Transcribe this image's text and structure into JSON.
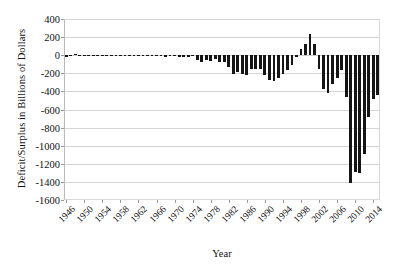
{
  "chart_data": {
    "type": "bar",
    "title": "",
    "xlabel": "Year",
    "ylabel": "Deficit/Surplus in Billions of Dollars",
    "ylim": [
      -1600,
      400
    ],
    "ytick_values": [
      400,
      200,
      0,
      -200,
      -400,
      -600,
      -800,
      -1000,
      -1200,
      -1400,
      -1600
    ],
    "ytick_labels": [
      "400",
      "200",
      "0",
      "-200",
      "-400",
      "-600",
      "-800",
      "-1000",
      "-1200",
      "-1400",
      "-1600"
    ],
    "xtick_labels": [
      "1946",
      "1950",
      "1954",
      "1958",
      "1962",
      "1966",
      "1970",
      "1974",
      "1978",
      "1982",
      "1986",
      "1990",
      "1994",
      "1998",
      "2002",
      "2006",
      "2010",
      "2014"
    ],
    "xtick_step": 4,
    "grid": true,
    "legend": "none",
    "bar_color": "#151515",
    "grid_color": "#d5d5d5",
    "categories": [
      "1946",
      "1947",
      "1948",
      "1949",
      "1950",
      "1951",
      "1952",
      "1953",
      "1954",
      "1955",
      "1956",
      "1957",
      "1958",
      "1959",
      "1960",
      "1961",
      "1962",
      "1963",
      "1964",
      "1965",
      "1966",
      "1967",
      "1968",
      "1969",
      "1970",
      "1971",
      "1972",
      "1973",
      "1974",
      "1975",
      "1976",
      "1977",
      "1978",
      "1979",
      "1980",
      "1981",
      "1982",
      "1983",
      "1984",
      "1985",
      "1986",
      "1987",
      "1988",
      "1989",
      "1990",
      "1991",
      "1992",
      "1993",
      "1994",
      "1995",
      "1996",
      "1997",
      "1998",
      "1999",
      "2000",
      "2001",
      "2002",
      "2003",
      "2004",
      "2005",
      "2006",
      "2007",
      "2008",
      "2009",
      "2010",
      "2011",
      "2012",
      "2013",
      "2014",
      "2015"
    ],
    "values": [
      -15.9,
      4.0,
      11.8,
      0.6,
      -3.1,
      6.1,
      -1.5,
      -6.5,
      -1.2,
      -3.0,
      3.9,
      3.4,
      -2.8,
      -12.8,
      0.3,
      -3.3,
      -7.1,
      -4.8,
      -5.9,
      -1.4,
      -3.7,
      -8.6,
      -25.2,
      3.2,
      -2.8,
      -23.0,
      -23.4,
      -14.9,
      -6.1,
      -53.2,
      -73.7,
      -53.7,
      -59.2,
      -40.7,
      -73.8,
      -79.0,
      -128.0,
      -207.8,
      -185.4,
      -212.3,
      -221.2,
      -149.7,
      -155.2,
      -152.6,
      -221.0,
      -269.2,
      -290.3,
      -255.1,
      -203.2,
      -164.0,
      -107.4,
      -21.9,
      69.3,
      125.6,
      236.2,
      128.2,
      -157.8,
      -377.6,
      -412.7,
      -318.3,
      -248.2,
      -160.7,
      -458.6,
      -1412.7,
      -1294.4,
      -1299.6,
      -1087.0,
      -679.5,
      -484.6,
      -438.0
    ],
    "units": "Billions of Dollars"
  }
}
